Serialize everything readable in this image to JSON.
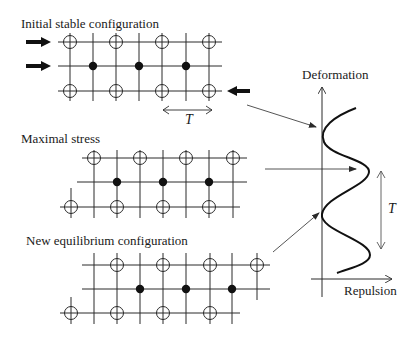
{
  "panels": [
    {
      "id": "initial",
      "title": "Initial stable configuration",
      "title_pos": [
        21,
        17
      ],
      "rows": [
        {
          "y": 42,
          "x1": 58,
          "x2": 222,
          "nodes": [
            {
              "x": 70,
              "t": "o"
            },
            {
              "x": 116,
              "t": "o"
            },
            {
              "x": 162,
              "t": "o"
            },
            {
              "x": 209,
              "t": "o"
            }
          ]
        },
        {
          "y": 66,
          "x1": 58,
          "x2": 222,
          "nodes": [
            {
              "x": 93,
              "t": "d"
            },
            {
              "x": 139,
              "t": "d"
            },
            {
              "x": 186,
              "t": "d"
            }
          ]
        },
        {
          "y": 91,
          "x1": 58,
          "x2": 222,
          "nodes": [
            {
              "x": 70,
              "t": "o"
            },
            {
              "x": 116,
              "t": "o"
            },
            {
              "x": 162,
              "t": "o"
            },
            {
              "x": 209,
              "t": "o"
            }
          ]
        }
      ],
      "verticals": [
        {
          "x": 70,
          "y1": 33,
          "y2": 101
        },
        {
          "x": 93,
          "y1": 33,
          "y2": 101
        },
        {
          "x": 116,
          "y1": 33,
          "y2": 101
        },
        {
          "x": 139,
          "y1": 33,
          "y2": 101
        },
        {
          "x": 162,
          "y1": 33,
          "y2": 101
        },
        {
          "x": 186,
          "y1": 33,
          "y2": 101
        },
        {
          "x": 209,
          "y1": 33,
          "y2": 101
        }
      ],
      "force_arrows": [
        {
          "x1": 26,
          "x2": 51,
          "y": 42,
          "dir": "right"
        },
        {
          "x1": 26,
          "x2": 51,
          "y": 66,
          "dir": "right"
        },
        {
          "x1": 250,
          "x2": 227,
          "y": 91,
          "dir": "left"
        }
      ],
      "period": {
        "x1": 163,
        "x2": 212,
        "y": 110,
        "label": "T",
        "label_pos": [
          185,
          113
        ]
      }
    },
    {
      "id": "maximal",
      "title": "Maximal stress",
      "title_pos": [
        21,
        132
      ],
      "rows": [
        {
          "y": 158,
          "x1": 82,
          "x2": 247,
          "nodes": [
            {
              "x": 94,
              "t": "o"
            },
            {
              "x": 140,
              "t": "o"
            },
            {
              "x": 186,
              "t": "o"
            },
            {
              "x": 233,
              "t": "o"
            }
          ]
        },
        {
          "y": 182,
          "x1": 77,
          "x2": 247,
          "nodes": [
            {
              "x": 117,
              "t": "d"
            },
            {
              "x": 163,
              "t": "d"
            },
            {
              "x": 209,
              "t": "d"
            }
          ]
        },
        {
          "y": 207,
          "x1": 60,
          "x2": 240,
          "nodes": [
            {
              "x": 71,
              "t": "o"
            },
            {
              "x": 117,
              "t": "o"
            },
            {
              "x": 163,
              "t": "o"
            },
            {
              "x": 209,
              "t": "o"
            }
          ]
        }
      ],
      "verticals": [
        {
          "x": 71,
          "y1": 188,
          "y2": 218
        },
        {
          "x": 94,
          "y1": 150,
          "y2": 218
        },
        {
          "x": 117,
          "y1": 150,
          "y2": 218
        },
        {
          "x": 140,
          "y1": 150,
          "y2": 218
        },
        {
          "x": 163,
          "y1": 150,
          "y2": 218
        },
        {
          "x": 186,
          "y1": 150,
          "y2": 218
        },
        {
          "x": 209,
          "y1": 150,
          "y2": 218
        },
        {
          "x": 233,
          "y1": 150,
          "y2": 218
        }
      ]
    },
    {
      "id": "new",
      "title": "New equilibrium configuration",
      "title_pos": [
        26,
        234
      ],
      "rows": [
        {
          "y": 265,
          "x1": 82,
          "x2": 270,
          "nodes": [
            {
              "x": 117,
              "t": "o"
            },
            {
              "x": 163,
              "t": "o"
            },
            {
              "x": 210,
              "t": "o"
            },
            {
              "x": 257,
              "t": "o"
            }
          ]
        },
        {
          "y": 289,
          "x1": 82,
          "x2": 270,
          "nodes": [
            {
              "x": 140,
              "t": "d"
            },
            {
              "x": 186,
              "t": "d"
            },
            {
              "x": 232,
              "t": "d"
            }
          ]
        },
        {
          "y": 313,
          "x1": 60,
          "x2": 240,
          "nodes": [
            {
              "x": 71,
              "t": "o"
            },
            {
              "x": 117,
              "t": "o"
            },
            {
              "x": 163,
              "t": "o"
            },
            {
              "x": 210,
              "t": "o"
            }
          ]
        }
      ],
      "verticals": [
        {
          "x": 71,
          "y1": 297,
          "y2": 324
        },
        {
          "x": 94,
          "y1": 253,
          "y2": 324
        },
        {
          "x": 117,
          "y1": 253,
          "y2": 324
        },
        {
          "x": 140,
          "y1": 253,
          "y2": 324
        },
        {
          "x": 163,
          "y1": 253,
          "y2": 324
        },
        {
          "x": 186,
          "y1": 253,
          "y2": 324
        },
        {
          "x": 210,
          "y1": 253,
          "y2": 324
        },
        {
          "x": 232,
          "y1": 253,
          "y2": 324
        },
        {
          "x": 257,
          "y1": 253,
          "y2": 300
        }
      ]
    }
  ],
  "graph": {
    "y_axis_label": "Deformation",
    "x_axis_label": "Repulsion",
    "y_label_pos": [
      302,
      68
    ],
    "x_label_pos": [
      344,
      284
    ],
    "axis_x": 322,
    "axis_top": 87,
    "axis_bottom": 297,
    "x_axis_y": 279,
    "x_axis_x1": 311,
    "x_axis_x2": 392,
    "curve_path": "M356,108 C335,116 318,128 324,142 C330,156 370,160 369,172 C368,186 325,196 322,214 C319,230 370,240 370,255 C370,264 350,268 337,273",
    "period": {
      "x": 381,
      "y1": 171,
      "y2": 249,
      "label": "T",
      "label_pos": [
        388,
        202
      ]
    }
  },
  "connectors": [
    {
      "x1": 247,
      "y1": 105,
      "x2": 316,
      "y2": 127
    },
    {
      "x1": 265,
      "y1": 169,
      "x2": 356,
      "y2": 169
    },
    {
      "x1": 273,
      "y1": 252,
      "x2": 319,
      "y2": 213
    }
  ],
  "colors": {
    "stroke": "#2a2a2a",
    "bg": "#ffffff"
  }
}
